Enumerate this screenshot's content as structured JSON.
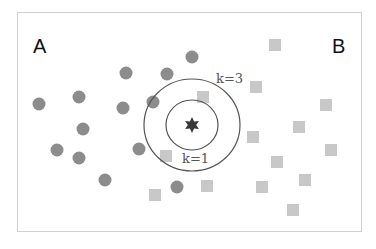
{
  "diagram": {
    "class_labels": {
      "a": "A",
      "b": "B"
    },
    "k_labels": {
      "inner": "k=1",
      "outer": "k=3"
    },
    "colors": {
      "frame": "#d0d0d0",
      "class_a": "#8c8c8c",
      "class_b": "#c8c8c8",
      "query": "#3a3a3a",
      "ring": "#555555"
    },
    "query_point": {
      "x": 192,
      "y": 125,
      "shape": "star"
    },
    "rings": [
      {
        "name": "k=1",
        "rx": 26,
        "ry": 25
      },
      {
        "name": "k=3",
        "rx": 48,
        "ry": 46
      }
    ],
    "class_a_points": [
      [
        39,
        104
      ],
      [
        79,
        97
      ],
      [
        83,
        129
      ],
      [
        57,
        150
      ],
      [
        79,
        158
      ],
      [
        105,
        180
      ],
      [
        126,
        73
      ],
      [
        167,
        74
      ],
      [
        192,
        57
      ],
      [
        123,
        108
      ],
      [
        153,
        102
      ],
      [
        139,
        149
      ],
      [
        177,
        187
      ]
    ],
    "class_b_points": [
      [
        203,
        97
      ],
      [
        166,
        156
      ],
      [
        155,
        195
      ],
      [
        275,
        45
      ],
      [
        256,
        87
      ],
      [
        326,
        105
      ],
      [
        299,
        127
      ],
      [
        253,
        137
      ],
      [
        331,
        150
      ],
      [
        277,
        162
      ],
      [
        305,
        180
      ],
      [
        262,
        187
      ],
      [
        293,
        210
      ],
      [
        207,
        186
      ]
    ]
  }
}
